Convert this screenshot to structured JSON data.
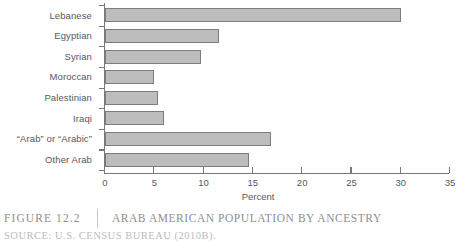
{
  "figure": {
    "number_label": "Figure 12.2",
    "title": "Arab American Population by Ancestry",
    "source": "Source: U.S. Census Bureau (2010b)."
  },
  "chart_data": {
    "type": "bar",
    "orientation": "horizontal",
    "title": "Arab American Population by Ancestry",
    "xlabel": "Percent",
    "ylabel": "",
    "xlim": [
      0,
      35
    ],
    "xticks": [
      0,
      5,
      10,
      15,
      20,
      25,
      30,
      35
    ],
    "xtick_labels": [
      "0",
      "5",
      "10",
      "15",
      "20",
      "25",
      "30",
      "35"
    ],
    "grid": false,
    "legend": "none",
    "categories": [
      "Lebanese",
      "Egyptian",
      "Syrian",
      "Moroccan",
      "Palestinian",
      "Iraqi",
      "“Arab” or “Arabic”",
      "Other Arab"
    ],
    "values": [
      30.0,
      11.6,
      9.7,
      5.0,
      5.4,
      6.0,
      16.8,
      14.6
    ],
    "bar_fill_color": "#bdbdbd",
    "bar_border_color": "#7c7c7c",
    "axis_color": "#77787b",
    "text_color": "#57585a"
  }
}
